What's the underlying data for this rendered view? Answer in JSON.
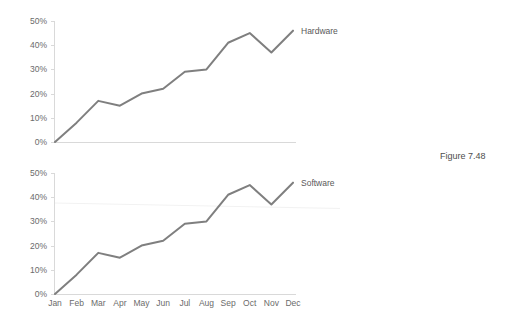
{
  "figure": {
    "caption": "Figure 7.48"
  },
  "chart_data": [
    {
      "type": "line",
      "title": "",
      "subtitle": "",
      "xlabel": "",
      "ylabel": "",
      "series_label": "Hardware",
      "categories": [
        "Jan",
        "Feb",
        "Mar",
        "Apr",
        "May",
        "Jun",
        "Jul",
        "Aug",
        "Sep",
        "Oct",
        "Nov",
        "Dec"
      ],
      "values": [
        0,
        8,
        17,
        15,
        20,
        22,
        29,
        30,
        41,
        45,
        37,
        46
      ],
      "ytick_labels": [
        "50%",
        "40%",
        "30%",
        "20%",
        "10%",
        "0%"
      ],
      "ytick_values": [
        50,
        40,
        30,
        20,
        10,
        0
      ],
      "ylim": [
        0,
        50
      ],
      "grid": false,
      "legend_position": "end-of-line",
      "line_color": "#7f7f7f",
      "axis_color": "#d9d9d9",
      "show_xtick_labels": false
    },
    {
      "type": "line",
      "title": "",
      "subtitle": "",
      "xlabel": "",
      "ylabel": "",
      "series_label": "Software",
      "categories": [
        "Jan",
        "Feb",
        "Mar",
        "Apr",
        "May",
        "Jun",
        "Jul",
        "Aug",
        "Sep",
        "Oct",
        "Nov",
        "Dec"
      ],
      "values": [
        0,
        8,
        17,
        15,
        20,
        22,
        29,
        30,
        41,
        45,
        37,
        46
      ],
      "ytick_labels": [
        "50%",
        "40%",
        "30%",
        "20%",
        "10%",
        "0%"
      ],
      "ytick_values": [
        50,
        40,
        30,
        20,
        10,
        0
      ],
      "ylim": [
        0,
        50
      ],
      "grid": false,
      "legend_position": "end-of-line",
      "line_color": "#7f7f7f",
      "axis_color": "#d9d9d9",
      "show_xtick_labels": true
    }
  ]
}
